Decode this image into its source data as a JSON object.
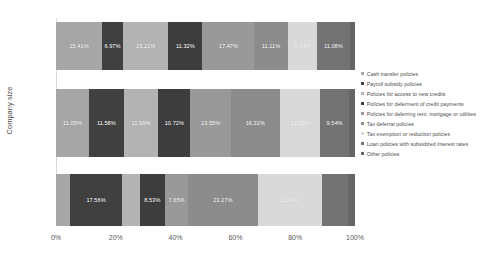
{
  "chart_data": {
    "type": "bar",
    "subtype": "horizontal-100-percent-stacked",
    "title": "",
    "xlabel": "",
    "ylabel": "Company size",
    "xlim": [
      0,
      100
    ],
    "xtick_labels": [
      "0%",
      "20%",
      "40%",
      "60%",
      "80%",
      "100%"
    ],
    "xticks": [
      0,
      20,
      40,
      60,
      80,
      100
    ],
    "grid": false,
    "legend_position": "right",
    "categories": [
      "Micro",
      "SMEs",
      "Large"
    ],
    "series": [
      {
        "name": "Cash transfer policies",
        "color": "#a6a6a6",
        "values": [
          15.41,
          11.05,
          4.62
        ],
        "labels": [
          "15.41%",
          "11.05%",
          ""
        ]
      },
      {
        "name": "Payroll subsidy policies",
        "color": "#404040",
        "values": [
          6.97,
          11.58,
          17.56
        ],
        "labels": [
          "6.97%",
          "11.58%",
          "17.56%"
        ]
      },
      {
        "name": "Policies for access to new credits",
        "color": "#b3b3b3",
        "values": [
          15.21,
          11.59,
          5.8
        ],
        "labels": [
          "15.21%",
          "11.59%",
          ""
        ]
      },
      {
        "name": "Policies for deferment of credit payments",
        "color": "#3d3d3d",
        "values": [
          11.32,
          10.72,
          8.53
        ],
        "labels": [
          "11.32%",
          "10.72%",
          "8.53%"
        ]
      },
      {
        "name": "Policies for deferring rent, mortgage or utilities",
        "color": "#999999",
        "values": [
          17.47,
          13.55,
          7.65
        ],
        "labels": [
          "17.47%",
          "13.55%",
          "7.65%"
        ]
      },
      {
        "name": "Tax deferral policies",
        "color": "#8c8c8c",
        "values": [
          11.11,
          16.32,
          23.27
        ],
        "labels": [
          "11.11%",
          "16.32%",
          "23.27%"
        ]
      },
      {
        "name": "Tax exemption or reduction policies",
        "color": "#d9d9d9",
        "values": [
          9.74,
          13.59,
          21.4
        ],
        "labels": [
          "9.74%",
          "13.59%",
          "21.40%"
        ]
      },
      {
        "name": "Loan policies with subsidized interest rates",
        "color": "#737373",
        "values": [
          11.08,
          9.54,
          8.95
        ],
        "labels": [
          "11.08%",
          "9.54%",
          ""
        ]
      },
      {
        "name": "Other policies",
        "color": "#666666",
        "values": [
          1.69,
          2.06,
          2.22
        ],
        "labels": [
          "",
          "",
          ""
        ]
      }
    ]
  }
}
